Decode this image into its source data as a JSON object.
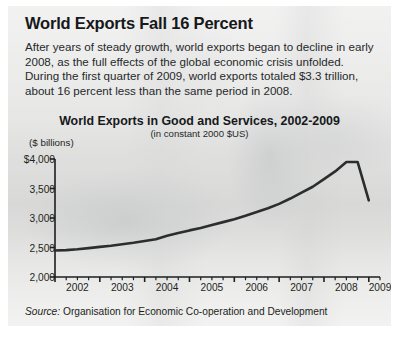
{
  "headline": "World Exports Fall 16 Percent",
  "deck": "After years of steady growth, world exports began to decline in early 2008, as the full effects of the global economic crisis unfolded. During the first quarter of 2009, world exports totaled $3.3 trillion, about 16 percent less than the same period in 2008.",
  "source_label": "Source:",
  "source_text": "Organisation for Economic Co-operation and Development",
  "colors": {
    "panel_background": "#d8d8d6",
    "line": "#2b2d2f",
    "axis": "#1d1f21",
    "text": "#16181a"
  },
  "chart_data": {
    "type": "line",
    "title": "World Exports in Good and Services, 2002-2009",
    "subtitle": "(in constant 2000 $US)",
    "unit_label": "($ billions)",
    "xlabel": "",
    "ylabel": "",
    "ylim": [
      2000,
      4000
    ],
    "yticks": [
      2000,
      2500,
      3000,
      3500,
      4000
    ],
    "ytick_labels": [
      "2,000",
      "2,500",
      "3,000",
      "3,500",
      "$4,000"
    ],
    "xlim": [
      2002.0,
      2009.25
    ],
    "xticks": [
      2002,
      2003,
      2004,
      2005,
      2006,
      2007,
      2008,
      2009
    ],
    "xtick_labels": [
      "2002",
      "2003",
      "2004",
      "2005",
      "2006",
      "2007",
      "2008",
      "2009"
    ],
    "minor_ticks_per_year": 4,
    "grid": false,
    "legend": "none",
    "series": [
      {
        "name": "World exports of goods and services",
        "x": [
          2002.0,
          2002.25,
          2002.5,
          2002.75,
          2003.0,
          2003.25,
          2003.5,
          2003.75,
          2004.0,
          2004.25,
          2004.5,
          2004.75,
          2005.0,
          2005.25,
          2005.5,
          2005.75,
          2006.0,
          2006.25,
          2006.5,
          2006.75,
          2007.0,
          2007.25,
          2007.5,
          2007.75,
          2008.0,
          2008.25,
          2008.5,
          2008.75,
          2009.0
        ],
        "values": [
          2450,
          2455,
          2470,
          2490,
          2510,
          2530,
          2555,
          2580,
          2610,
          2640,
          2700,
          2745,
          2790,
          2830,
          2880,
          2930,
          2980,
          3040,
          3100,
          3165,
          3240,
          3330,
          3430,
          3530,
          3660,
          3790,
          3950,
          3950,
          3300
        ]
      }
    ]
  }
}
